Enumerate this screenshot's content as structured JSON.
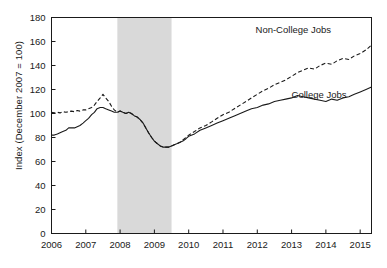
{
  "chart_data": {
    "type": "line",
    "title": "",
    "xlabel": "",
    "ylabel": "Index (December 2007 = 100)",
    "xlim": [
      2006.0,
      2015.33
    ],
    "ylim": [
      0,
      180
    ],
    "yticks": [
      0,
      20,
      40,
      60,
      80,
      100,
      120,
      140,
      160,
      180
    ],
    "xticks": [
      2006,
      2007,
      2008,
      2009,
      2010,
      2011,
      2012,
      2013,
      2014,
      2015
    ],
    "xtick_labels": [
      "2006",
      "2007",
      "2008",
      "2009",
      "2010",
      "2011",
      "2012",
      "2013",
      "2014",
      "2015"
    ],
    "ytick_labels": [
      "0",
      "20",
      "40",
      "60",
      "80",
      "100",
      "120",
      "140",
      "160",
      "180"
    ],
    "grid": false,
    "legend_position": "inline-annotations",
    "annotations": [
      {
        "label": "Non-College Jobs",
        "x": 2013.05,
        "y": 167,
        "series": "non_college"
      },
      {
        "label": "College Jobs",
        "x": 2013.8,
        "y": 113,
        "series": "college"
      }
    ],
    "shaded_regions": [
      {
        "label": "recession",
        "x0": 2007.92,
        "x1": 2009.5,
        "color": "#d9d9d9"
      }
    ],
    "series": [
      {
        "name": "Non-College Jobs",
        "style": "dashed",
        "color": "#1a1a1a",
        "x": [
          2006.0,
          2006.08,
          2006.17,
          2006.25,
          2006.33,
          2006.42,
          2006.5,
          2006.58,
          2006.67,
          2006.75,
          2006.83,
          2006.92,
          2007.0,
          2007.08,
          2007.17,
          2007.25,
          2007.33,
          2007.42,
          2007.5,
          2007.58,
          2007.67,
          2007.75,
          2007.83,
          2007.92,
          2008.0,
          2008.08,
          2008.17,
          2008.25,
          2008.33,
          2008.42,
          2008.5,
          2008.58,
          2008.67,
          2008.75,
          2008.83,
          2008.92,
          2009.0,
          2009.08,
          2009.17,
          2009.25,
          2009.33,
          2009.42,
          2009.5,
          2009.58,
          2009.67,
          2009.75,
          2009.83,
          2009.92,
          2010.0,
          2010.17,
          2010.33,
          2010.5,
          2010.67,
          2010.83,
          2011.0,
          2011.17,
          2011.33,
          2011.5,
          2011.67,
          2011.83,
          2012.0,
          2012.17,
          2012.33,
          2012.5,
          2012.67,
          2012.83,
          2013.0,
          2013.17,
          2013.33,
          2013.5,
          2013.67,
          2013.83,
          2014.0,
          2014.17,
          2014.33,
          2014.5,
          2014.67,
          2014.83,
          2015.0,
          2015.17,
          2015.33
        ],
        "y": [
          101,
          100.5,
          101,
          100.5,
          101.5,
          101,
          101.5,
          102,
          101.5,
          102.5,
          102,
          103,
          103,
          104,
          105,
          107,
          110,
          113,
          116,
          113,
          110,
          106,
          103,
          101,
          102,
          101,
          100,
          101,
          100,
          98,
          97,
          95,
          92,
          88,
          84,
          80,
          77,
          75,
          73,
          72,
          72,
          72,
          73,
          74,
          75,
          76,
          78,
          80,
          82,
          85,
          88,
          90,
          93,
          96,
          99,
          101,
          104,
          107,
          110,
          113,
          116,
          119,
          121,
          124,
          126,
          128,
          131,
          134,
          136,
          138,
          137,
          140,
          142,
          141,
          144,
          146,
          145,
          148,
          150,
          153,
          157
        ]
      },
      {
        "name": "College Jobs",
        "style": "solid",
        "color": "#1a1a1a",
        "x": [
          2006.0,
          2006.08,
          2006.17,
          2006.25,
          2006.33,
          2006.42,
          2006.5,
          2006.58,
          2006.67,
          2006.75,
          2006.83,
          2006.92,
          2007.0,
          2007.08,
          2007.17,
          2007.25,
          2007.33,
          2007.42,
          2007.5,
          2007.58,
          2007.67,
          2007.75,
          2007.83,
          2007.92,
          2008.0,
          2008.08,
          2008.17,
          2008.25,
          2008.33,
          2008.42,
          2008.5,
          2008.58,
          2008.67,
          2008.75,
          2008.83,
          2008.92,
          2009.0,
          2009.08,
          2009.17,
          2009.25,
          2009.33,
          2009.42,
          2009.5,
          2009.58,
          2009.67,
          2009.75,
          2009.83,
          2009.92,
          2010.0,
          2010.17,
          2010.33,
          2010.5,
          2010.67,
          2010.83,
          2011.0,
          2011.17,
          2011.33,
          2011.5,
          2011.67,
          2011.83,
          2012.0,
          2012.17,
          2012.33,
          2012.5,
          2012.67,
          2012.83,
          2013.0,
          2013.17,
          2013.33,
          2013.5,
          2013.67,
          2013.83,
          2014.0,
          2014.17,
          2014.33,
          2014.5,
          2014.67,
          2014.83,
          2015.0,
          2015.17,
          2015.33
        ],
        "y": [
          82,
          82,
          83,
          84,
          85,
          86,
          88,
          88,
          88,
          89,
          90,
          92,
          94,
          96,
          99,
          101,
          104,
          105,
          105,
          104,
          103,
          102,
          101,
          101,
          102,
          101,
          100,
          101,
          100,
          98,
          97,
          95,
          92,
          88,
          84,
          80,
          77,
          75,
          73,
          72,
          72,
          72,
          73,
          74,
          75,
          76,
          77,
          79,
          81,
          83,
          86,
          88,
          90,
          92,
          94,
          96,
          98,
          100,
          102,
          104,
          105,
          107,
          108,
          110,
          111,
          112,
          113,
          115,
          114,
          113,
          112,
          111,
          110,
          112,
          111,
          113,
          114,
          116,
          118,
          120,
          122
        ]
      }
    ]
  }
}
